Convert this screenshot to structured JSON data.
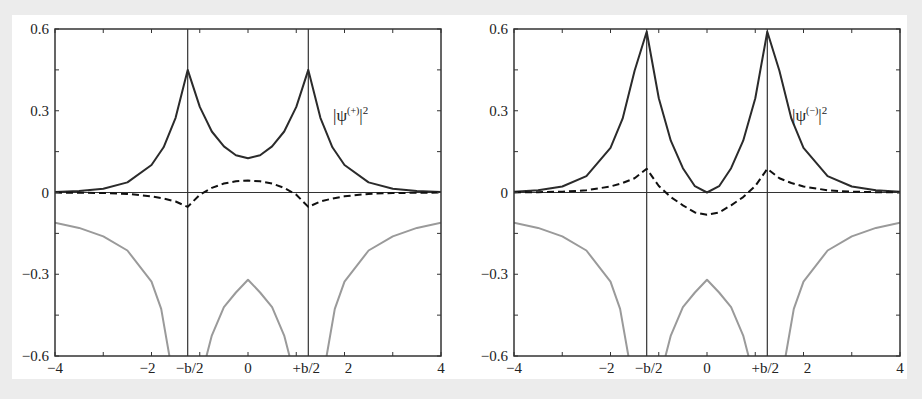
{
  "chart_data": [
    {
      "type": "line",
      "title": "",
      "panel": "left",
      "annotation": {
        "base": "|ψ",
        "sup": "(+)",
        "tail": "|",
        "sup2": "2"
      },
      "xlabel": "",
      "ylabel": "",
      "xlim": [
        -4,
        4
      ],
      "ylim": [
        -0.6,
        0.6
      ],
      "x_ticks": [
        -4,
        -3,
        -2,
        -1,
        0,
        1,
        2,
        3,
        4
      ],
      "x_tick_labels": [
        {
          "x": -4,
          "label": "−4"
        },
        {
          "x": -2,
          "label": "−2"
        },
        {
          "x": -1.25,
          "label": "−b/2"
        },
        {
          "x": 0,
          "label": "0"
        },
        {
          "x": 1.25,
          "label": "+b/2"
        },
        {
          "x": 2,
          "label": "2"
        },
        {
          "x": 4,
          "label": "4"
        }
      ],
      "y_ticks": [
        -0.6,
        -0.45,
        -0.3,
        -0.15,
        0,
        0.15,
        0.3,
        0.45,
        0.6
      ],
      "y_tick_labels": [
        {
          "y": 0.6,
          "label": "0.6"
        },
        {
          "y": 0.3,
          "label": "0.3"
        },
        {
          "y": 0,
          "label": "0"
        },
        {
          "y": -0.3,
          "label": "−0.3"
        },
        {
          "y": -0.6,
          "label": "−0.6"
        }
      ],
      "vertical_lines": [
        -1.25,
        1.25
      ],
      "horizontal_lines": [
        0
      ],
      "grid": false,
      "series": [
        {
          "name": "|ψ(+)|²",
          "style": "solid-dark",
          "x": [
            -4,
            -3.5,
            -3,
            -2.5,
            -2,
            -1.75,
            -1.5,
            -1.25,
            -1,
            -0.75,
            -0.5,
            -0.25,
            0,
            0.25,
            0.5,
            0.75,
            1,
            1.25,
            1.5,
            1.75,
            2,
            2.5,
            3,
            3.5,
            4
          ],
          "values": [
            0.002,
            0.005,
            0.014,
            0.037,
            0.101,
            0.166,
            0.274,
            0.45,
            0.314,
            0.224,
            0.169,
            0.137,
            0.126,
            0.137,
            0.169,
            0.224,
            0.314,
            0.45,
            0.274,
            0.166,
            0.101,
            0.037,
            0.014,
            0.005,
            0.002
          ]
        },
        {
          "name": "density difference (+)",
          "style": "dashed",
          "x": [
            -4,
            -3.5,
            -3,
            -2.5,
            -2,
            -1.75,
            -1.5,
            -1.25,
            -1,
            -0.75,
            -0.5,
            -0.25,
            0,
            0.25,
            0.5,
            0.75,
            1,
            1.25,
            1.5,
            1.75,
            2,
            2.5,
            3,
            3.5,
            4
          ],
          "values": [
            -0.0003,
            -0.001,
            -0.002,
            -0.005,
            -0.014,
            -0.022,
            -0.033,
            -0.053,
            -0.008,
            0.017,
            0.033,
            0.041,
            0.044,
            0.041,
            0.033,
            0.017,
            -0.008,
            -0.053,
            -0.033,
            -0.022,
            -0.014,
            -0.005,
            -0.002,
            -0.001,
            -0.0003
          ]
        },
        {
          "name": "potential V(x)",
          "style": "solid-grey",
          "x": [
            -4,
            -3.5,
            -3,
            -2.5,
            -2,
            -1.8,
            -1.63,
            "gap",
            -0.86,
            -0.75,
            -0.5,
            -0.25,
            0,
            0.25,
            0.5,
            0.75,
            0.86,
            "gap",
            1.63,
            1.8,
            2,
            2.5,
            3,
            3.5,
            4
          ],
          "values": [
            -0.111,
            -0.13,
            -0.161,
            -0.213,
            -0.327,
            -0.427,
            -0.6,
            null,
            -0.6,
            -0.525,
            -0.421,
            -0.367,
            -0.32,
            -0.367,
            -0.421,
            -0.525,
            -0.6,
            null,
            -0.6,
            -0.427,
            -0.327,
            -0.213,
            -0.161,
            -0.13,
            -0.111
          ]
        }
      ]
    },
    {
      "type": "line",
      "title": "",
      "panel": "right",
      "annotation": {
        "base": "|ψ",
        "sup": "(−)",
        "tail": "|",
        "sup2": "2"
      },
      "xlabel": "",
      "ylabel": "",
      "xlim": [
        -4,
        4
      ],
      "ylim": [
        -0.6,
        0.6
      ],
      "x_ticks": [
        -4,
        -3,
        -2,
        -1,
        0,
        1,
        2,
        3,
        4
      ],
      "x_tick_labels": [
        {
          "x": -4,
          "label": "−4"
        },
        {
          "x": -2,
          "label": "−2"
        },
        {
          "x": -1.25,
          "label": "−b/2"
        },
        {
          "x": 0,
          "label": "0"
        },
        {
          "x": 1.25,
          "label": "+b/2"
        },
        {
          "x": 2,
          "label": "2"
        },
        {
          "x": 4,
          "label": "4"
        }
      ],
      "y_ticks": [
        -0.6,
        -0.45,
        -0.3,
        -0.15,
        0,
        0.15,
        0.3,
        0.45,
        0.6
      ],
      "y_tick_labels": [
        {
          "y": 0.6,
          "label": "0.6"
        },
        {
          "y": 0.3,
          "label": "0.3"
        },
        {
          "y": 0,
          "label": "0"
        },
        {
          "y": -0.3,
          "label": "−0.3"
        },
        {
          "y": -0.6,
          "label": "−0.6"
        }
      ],
      "vertical_lines": [
        -1.25,
        1.25
      ],
      "horizontal_lines": [
        0
      ],
      "grid": false,
      "series": [
        {
          "name": "|ψ(−)|²",
          "style": "solid-dark",
          "x": [
            -4,
            -3.5,
            -3,
            -2.5,
            -2,
            -1.75,
            -1.5,
            -1.25,
            -1,
            -0.75,
            -0.5,
            -0.25,
            0,
            0.25,
            0.5,
            0.75,
            1,
            1.25,
            1.5,
            1.75,
            2,
            2.5,
            3,
            3.5,
            4
          ],
          "values": [
            0.003,
            0.008,
            0.022,
            0.06,
            0.164,
            0.271,
            0.447,
            0.59,
            0.346,
            0.19,
            0.089,
            0.023,
            0.0,
            0.023,
            0.089,
            0.19,
            0.346,
            0.59,
            0.447,
            0.271,
            0.164,
            0.06,
            0.022,
            0.008,
            0.003
          ]
        },
        {
          "name": "density difference (−)",
          "style": "dashed",
          "x": [
            -4,
            -3.5,
            -3,
            -2.5,
            -2,
            -1.75,
            -1.5,
            -1.25,
            -1,
            -0.75,
            -0.5,
            -0.25,
            0,
            0.25,
            0.5,
            0.75,
            1,
            1.25,
            1.5,
            1.75,
            2,
            2.5,
            3,
            3.5,
            4
          ],
          "values": [
            0.0003,
            0.001,
            0.003,
            0.008,
            0.022,
            0.035,
            0.052,
            0.087,
            0.024,
            -0.017,
            -0.047,
            -0.073,
            -0.082,
            -0.073,
            -0.047,
            -0.017,
            0.024,
            0.087,
            0.052,
            0.035,
            0.022,
            0.008,
            0.003,
            0.001,
            0.0003
          ]
        },
        {
          "name": "potential V(x)",
          "style": "solid-grey",
          "x": [
            -4,
            -3.5,
            -3,
            -2.5,
            -2,
            -1.8,
            -1.63,
            "gap",
            -0.86,
            -0.75,
            -0.5,
            -0.25,
            0,
            0.25,
            0.5,
            0.75,
            0.86,
            "gap",
            1.63,
            1.8,
            2,
            2.5,
            3,
            3.5,
            4
          ],
          "values": [
            -0.111,
            -0.13,
            -0.161,
            -0.213,
            -0.327,
            -0.427,
            -0.6,
            null,
            -0.6,
            -0.525,
            -0.421,
            -0.367,
            -0.32,
            -0.367,
            -0.421,
            -0.525,
            -0.6,
            null,
            -0.6,
            -0.427,
            -0.327,
            -0.213,
            -0.161,
            -0.13,
            -0.111
          ]
        }
      ]
    }
  ],
  "colors": {
    "background": "#ececec",
    "sheet": "#ffffff",
    "axis": "#333333",
    "density_curve": "#2b2b2b",
    "dashed_curve": "#111111",
    "potential_curve": "#9a9a9a"
  },
  "model": {
    "half_separation": 1.25,
    "potential_scale": 0.2
  }
}
